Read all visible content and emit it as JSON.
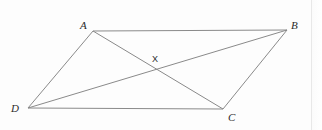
{
  "figure": {
    "kind": "geometry-diagram",
    "shape_name": "parallelogram",
    "background_color": "#fdfdfd",
    "stroke_color": "#8a8a8a",
    "label_color": "#2b2b2b",
    "stroke_width": 1,
    "width": 322,
    "height": 130,
    "vertices": [
      {
        "id": "A",
        "label": "A",
        "x": 93,
        "y": 31,
        "label_x": 80,
        "label_y": 20
      },
      {
        "id": "B",
        "label": "B",
        "x": 287,
        "y": 30,
        "label_x": 291,
        "label_y": 20
      },
      {
        "id": "C",
        "label": "C",
        "x": 223,
        "y": 109,
        "label_x": 228,
        "label_y": 112
      },
      {
        "id": "D",
        "label": "D",
        "x": 28,
        "y": 108,
        "label_x": 11,
        "label_y": 103
      }
    ],
    "interior_points": [
      {
        "id": "X",
        "label": "X",
        "x": 158,
        "y": 68,
        "label_x": 152,
        "label_y": 55
      }
    ],
    "segments": [
      {
        "id": "AB",
        "from": "A",
        "to": "B",
        "role": "side"
      },
      {
        "id": "BC",
        "from": "B",
        "to": "C",
        "role": "side"
      },
      {
        "id": "CD",
        "from": "C",
        "to": "D",
        "role": "side"
      },
      {
        "id": "DA",
        "from": "D",
        "to": "A",
        "role": "side"
      },
      {
        "id": "AC",
        "from": "A",
        "to": "C",
        "role": "diagonal"
      },
      {
        "id": "DB",
        "from": "D",
        "to": "B",
        "role": "diagonal"
      }
    ]
  }
}
